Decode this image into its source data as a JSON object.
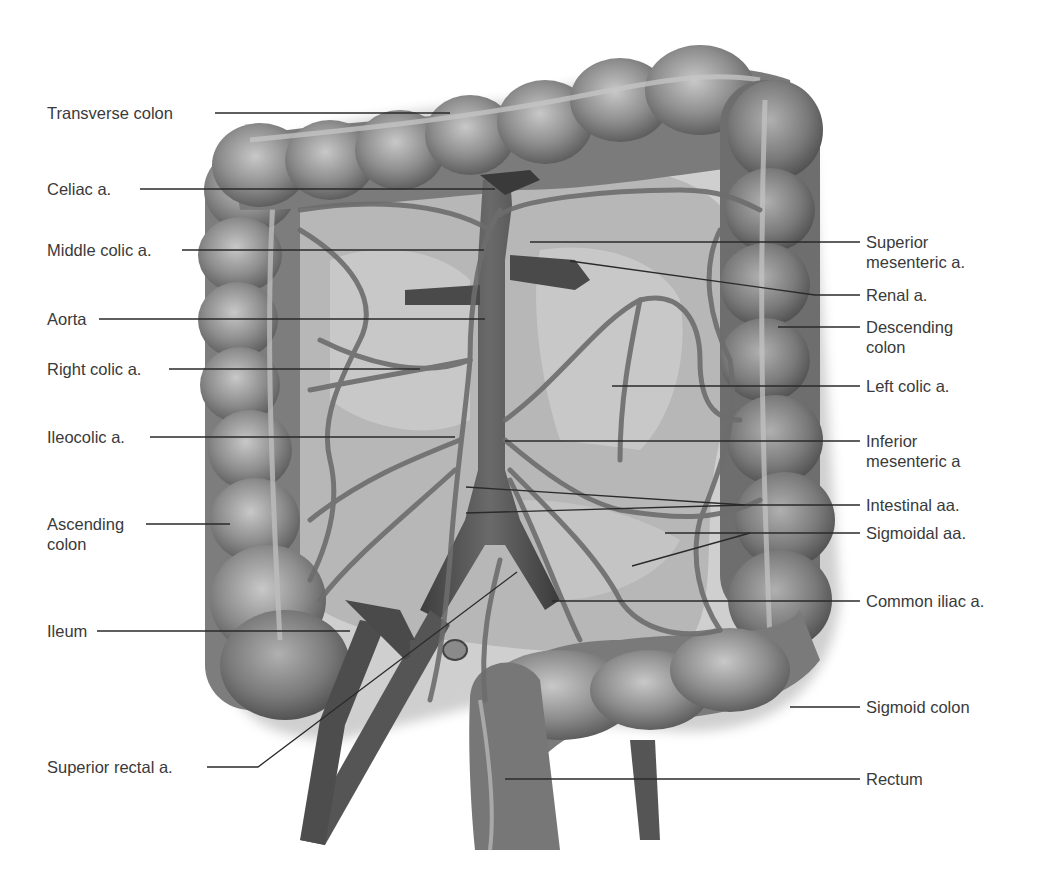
{
  "diagram": {
    "type": "anatomical-illustration",
    "colors": {
      "background": "#ffffff",
      "label_text": "#3a3a3a",
      "leader_line": "#2a2a2a",
      "colon_fill": "#8e8e8e",
      "colon_dark": "#5e5e5e",
      "mesentery_fill": "#cfcfcf",
      "artery_fill": "#4f4f4f"
    },
    "labels_left": [
      {
        "id": "transverse-colon",
        "text": "Transverse colon"
      },
      {
        "id": "celiac-a",
        "text": "Celiac a."
      },
      {
        "id": "middle-colic-a",
        "text": "Middle colic a."
      },
      {
        "id": "aorta",
        "text": "Aorta"
      },
      {
        "id": "right-colic-a",
        "text": "Right colic a."
      },
      {
        "id": "ileocolic-a",
        "text": "Ileocolic a."
      },
      {
        "id": "ascending-colon",
        "text": "Ascending colon"
      },
      {
        "id": "ileum",
        "text": "Ileum"
      },
      {
        "id": "superior-rectal-a",
        "text": "Superior rectal a."
      }
    ],
    "labels_right": [
      {
        "id": "superior-mesenteric-a",
        "text": "Superior mesenteric a."
      },
      {
        "id": "renal-a",
        "text": "Renal a."
      },
      {
        "id": "descending-colon",
        "text": "Descending colon"
      },
      {
        "id": "left-colic-a",
        "text": "Left colic a."
      },
      {
        "id": "inferior-mesenteric-a",
        "text": "Inferior mesenteric a"
      },
      {
        "id": "intestinal-aa",
        "text": "Intestinal aa."
      },
      {
        "id": "sigmoidal-aa",
        "text": "Sigmoidal aa."
      },
      {
        "id": "common-iliac-a",
        "text": "Common iliac a."
      },
      {
        "id": "sigmoid-colon",
        "text": "Sigmoid colon"
      },
      {
        "id": "rectum",
        "text": "Rectum"
      }
    ],
    "split_labels": {
      "ascending_colon": [
        "Ascending",
        "colon"
      ],
      "superior_mesenteric": [
        "Superior",
        "mesenteric a."
      ],
      "descending_colon": [
        "Descending",
        "colon"
      ],
      "inferior_mesenteric": [
        "Inferior",
        "mesenteric a"
      ]
    }
  }
}
